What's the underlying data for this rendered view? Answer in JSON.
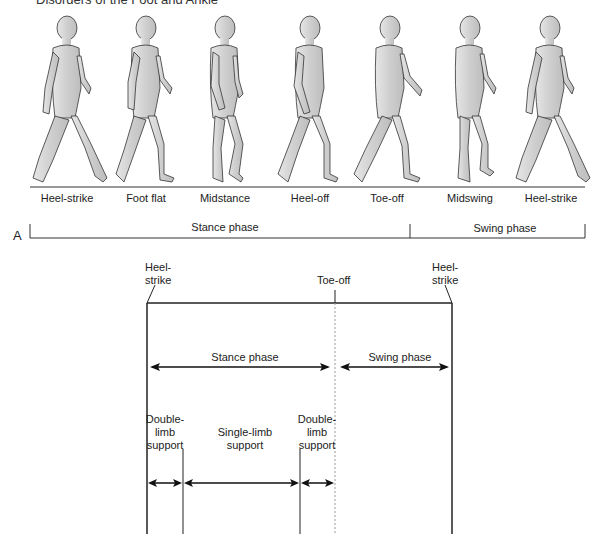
{
  "header": {
    "title": "Disorders of the Foot and Ankle"
  },
  "panel_a": {
    "label": "A",
    "figures": [
      {
        "label": "Heel-strike",
        "x": 67
      },
      {
        "label": "Foot flat",
        "x": 146
      },
      {
        "label": "Midstance",
        "x": 225
      },
      {
        "label": "Heel-off",
        "x": 310
      },
      {
        "label": "Toe-off",
        "x": 390
      },
      {
        "label": "Midswing",
        "x": 470
      },
      {
        "label": "Heel-strike",
        "x": 550
      }
    ],
    "phases": [
      {
        "label": "Stance phase"
      },
      {
        "label": "Swing phase"
      }
    ]
  },
  "panel_b": {
    "events": {
      "heel_strike_left": "Heel-\nstrike",
      "toe_off": "Toe-off",
      "heel_strike_right": "Heel-\nstrike"
    },
    "phases": {
      "stance": "Stance phase",
      "swing": "Swing phase"
    },
    "support": {
      "double_left": "Double-\nlimb\nsupport",
      "single": "Single-limb\nsupport",
      "double_right": "Double-\nlimb\nsupport"
    }
  }
}
